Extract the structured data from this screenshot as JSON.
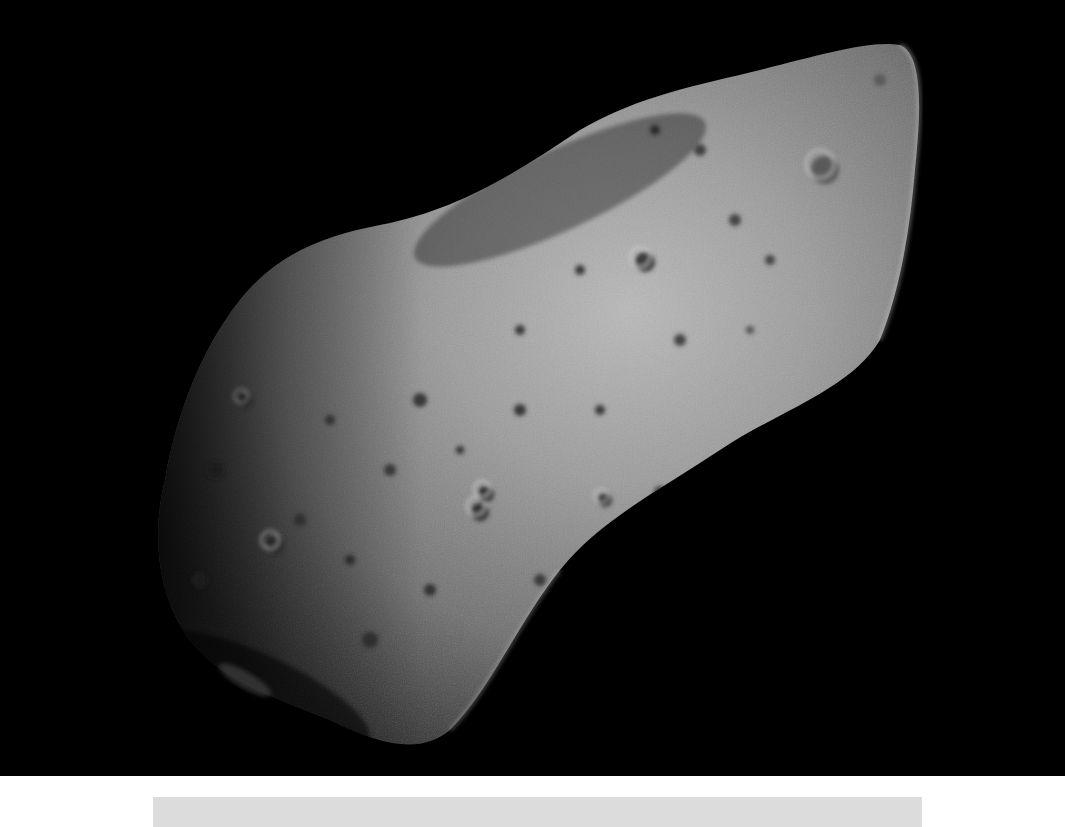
{
  "image": {
    "subject": "asteroid",
    "description": "Cratered elongated asteroid against black space",
    "background_color": "#000000",
    "surface_color": "#8a8a8a"
  },
  "caption_bar": {
    "text": "",
    "color": "#dcdcdc"
  }
}
